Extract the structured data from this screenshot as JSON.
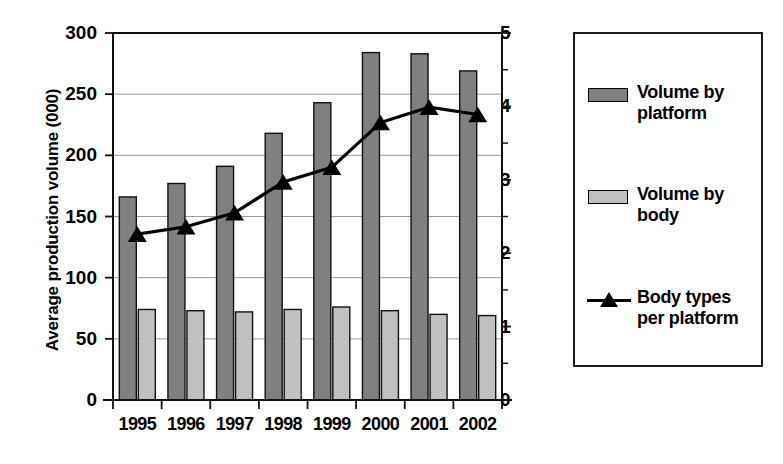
{
  "chart_data": {
    "type": "bar",
    "title": "",
    "xlabel": "",
    "ylabel": "Average production volume (000)",
    "y2label": "Number of body styles per platform",
    "categories": [
      "1995",
      "1996",
      "1997",
      "1998",
      "1999",
      "2000",
      "2001",
      "2002"
    ],
    "ylim": [
      0,
      300
    ],
    "yticks": [
      0,
      50,
      100,
      150,
      200,
      250,
      300
    ],
    "ytick_labels": [
      "0",
      "50",
      "100",
      "150",
      "200",
      "250",
      "300"
    ],
    "y2lim": [
      0,
      5
    ],
    "y2ticks": [
      0,
      1,
      2,
      3,
      4,
      5
    ],
    "y2tick_labels": [
      "0",
      "1",
      "2",
      "3",
      "4",
      "5"
    ],
    "grid": true,
    "legend_position": "right",
    "series": [
      {
        "name": "Volume by platform",
        "type": "bar",
        "axis": "left",
        "color": "#808080",
        "values": [
          166,
          177,
          191,
          218,
          243,
          284,
          283,
          269
        ]
      },
      {
        "name": "Volume by body",
        "type": "bar",
        "axis": "left",
        "color": "#c0c0c0",
        "values": [
          74,
          73,
          72,
          74,
          76,
          73,
          70,
          69
        ]
      },
      {
        "name": "Body types per platform",
        "type": "line",
        "axis": "right",
        "color": "#000000",
        "marker": "triangle",
        "values": [
          2.26,
          2.36,
          2.55,
          2.97,
          3.17,
          3.78,
          3.99,
          3.89
        ]
      }
    ]
  },
  "axes": {
    "left_title": "Average production volume (000)",
    "right_title": "Number of body styles per platform"
  },
  "legend": {
    "entries": [
      {
        "label": "Volume by platform",
        "key": "bar-swatch-dark"
      },
      {
        "label": "Volume by body",
        "key": "bar-swatch-light"
      },
      {
        "label": "Body types per platform",
        "key": "line-triangle-marker"
      }
    ]
  }
}
